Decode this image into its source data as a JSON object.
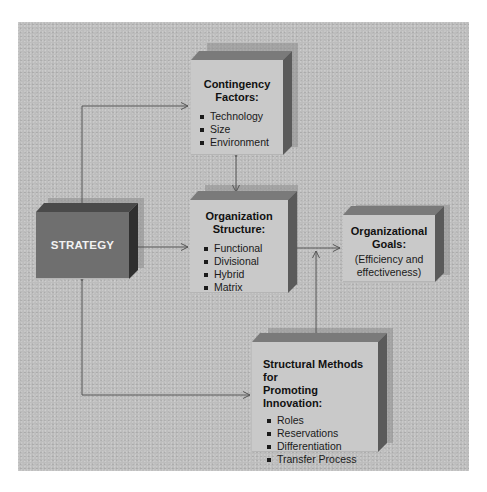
{
  "diagram": {
    "strategy": {
      "label": "STRATEGY"
    },
    "contingency": {
      "title_line1": "Contingency",
      "title_line2": "Factors:",
      "items": [
        "Technology",
        "Size",
        "Environment"
      ]
    },
    "structure": {
      "title_line1": "Organization",
      "title_line2": "Structure:",
      "items": [
        "Functional",
        "Divisional",
        "Hybrid",
        "Matrix"
      ]
    },
    "goals": {
      "title_line1": "Organizational",
      "title_line2": "Goals:",
      "desc_line1": "(Efficiency and",
      "desc_line2": "effectiveness)"
    },
    "innovation": {
      "title_line1": "Structural Methods for",
      "title_line2": "Promoting Innovation:",
      "items": [
        "Roles",
        "Reservations",
        "Differentiation",
        "Transfer Process"
      ]
    },
    "connections": [
      {
        "from": "strategy",
        "to": "contingency",
        "direction": "bidirectional"
      },
      {
        "from": "contingency",
        "to": "structure",
        "direction": "bidirectional"
      },
      {
        "from": "strategy",
        "to": "structure",
        "direction": "bidirectional"
      },
      {
        "from": "structure",
        "to": "goals",
        "direction": "one-way"
      },
      {
        "from": "innovation",
        "to": "goals",
        "direction": "one-way"
      },
      {
        "from": "strategy",
        "to": "innovation",
        "direction": "bidirectional"
      }
    ],
    "colors": {
      "background_panel": "#bdbdbd",
      "box_face": "#c9c9c9",
      "strategy_face": "#6f6f6f",
      "arrow": "#555555"
    }
  }
}
